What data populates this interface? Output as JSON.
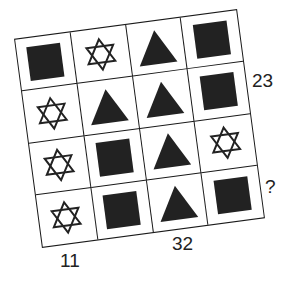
{
  "puzzle": {
    "grid": [
      [
        "square",
        "star",
        "triangle",
        "square"
      ],
      [
        "star",
        "triangle",
        "triangle",
        "square"
      ],
      [
        "star",
        "square",
        "triangle",
        "star"
      ],
      [
        "star",
        "square",
        "triangle",
        "square"
      ]
    ],
    "row_labels": {
      "row2": "23",
      "row4": "?"
    },
    "column_labels": {
      "col1": "11",
      "col3": "32"
    }
  }
}
